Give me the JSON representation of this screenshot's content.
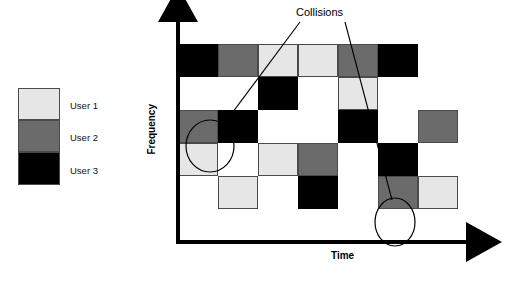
{
  "legend": {
    "items": [
      {
        "label": "User 1",
        "color": "#e6e6e6",
        "swatch_name": "legend-swatch-user-1"
      },
      {
        "label": "User 2",
        "color": "#6b6b6b",
        "swatch_name": "legend-swatch-user-2"
      },
      {
        "label": "User 3",
        "color": "#000000",
        "swatch_name": "legend-swatch-user-3"
      }
    ]
  },
  "chart_data": {
    "type": "heatmap",
    "title": "",
    "xlabel": "Time",
    "ylabel": "Frequency",
    "grid": false,
    "legend_position": "left",
    "x_axis": {
      "arrow": true,
      "ticks": [],
      "label": "Time"
    },
    "y_axis": {
      "arrow": true,
      "ticks": [],
      "label": "Frequency"
    },
    "categories": [
      "User 1",
      "User 2",
      "User 3"
    ],
    "colors": {
      "User 1": "#e6e6e6",
      "User 2": "#6b6b6b",
      "User 3": "#000000"
    },
    "columns": 7,
    "rows": 6,
    "cells": [
      {
        "col": 0,
        "row": 3,
        "user": "User 1"
      },
      {
        "col": 0,
        "row": 4,
        "user": "User 2"
      },
      {
        "col": 0,
        "row": 6,
        "user": "User 3"
      },
      {
        "col": 1,
        "row": 2,
        "user": "User 1"
      },
      {
        "col": 1,
        "row": 4,
        "user": "User 3"
      },
      {
        "col": 1,
        "row": 6,
        "user": "User 2"
      },
      {
        "col": 2,
        "row": 3,
        "user": "User 1"
      },
      {
        "col": 2,
        "row": 5,
        "user": "User 3"
      },
      {
        "col": 2,
        "row": 6,
        "user": "User 1"
      },
      {
        "col": 3,
        "row": 2,
        "user": "User 3"
      },
      {
        "col": 3,
        "row": 3,
        "user": "User 2"
      },
      {
        "col": 3,
        "row": 6,
        "user": "User 1"
      },
      {
        "col": 4,
        "row": 4,
        "user": "User 3"
      },
      {
        "col": 4,
        "row": 5,
        "user": "User 1"
      },
      {
        "col": 4,
        "row": 6,
        "user": "User 2"
      },
      {
        "col": 5,
        "row": 2,
        "user": "User 2"
      },
      {
        "col": 5,
        "row": 3,
        "user": "User 3"
      },
      {
        "col": 5,
        "row": 6,
        "user": "User 3"
      },
      {
        "col": 6,
        "row": 2,
        "user": "User 1"
      },
      {
        "col": 6,
        "row": 4,
        "user": "User 2"
      }
    ],
    "annotations": [
      {
        "text": "Collisions",
        "marker": "ellipse",
        "targets": [
          {
            "col": 0,
            "row": 4
          },
          {
            "col": 5,
            "row": 6
          }
        ]
      }
    ]
  },
  "annotations": {
    "collisions_label": "Collisions"
  },
  "axis_labels": {
    "x": "Time",
    "y": "Frequency"
  }
}
